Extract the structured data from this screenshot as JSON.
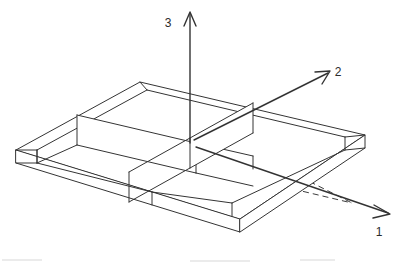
{
  "figure": {
    "background_color": "#ffffff",
    "line_color": "#343434",
    "hidden_line_color": "#3d3d3d",
    "axis_color": "#333333",
    "label_color": "#2b2b2b"
  },
  "axes": {
    "origin": {
      "x": 190,
      "y": 143
    },
    "items": [
      {
        "id": "axis-1",
        "label": "1",
        "direction": "down-right",
        "label_x": 379,
        "label_y": 232,
        "tip_x": 390,
        "tip_y": 214,
        "start_x": 196,
        "start_y": 147
      },
      {
        "id": "axis-2",
        "label": "2",
        "direction": "up-right",
        "label_x": 336,
        "label_y": 78,
        "tip_x": 330,
        "tip_y": 71,
        "start_x": 194,
        "start_y": 140
      },
      {
        "id": "axis-3",
        "label": "3",
        "direction": "up",
        "label_x": 168,
        "label_y": 23,
        "tip_x": 190,
        "tip_y": 12,
        "start_x": 190,
        "start_y": 143
      }
    ]
  },
  "slab": {
    "name": "four-compartment-slab",
    "compartment_count": 4,
    "partition_count": 2,
    "projection": "isometric",
    "top_outline": [
      {
        "x": 16,
        "y": 150
      },
      {
        "x": 140,
        "y": 82
      },
      {
        "x": 365,
        "y": 135
      },
      {
        "x": 240,
        "y": 219
      }
    ],
    "thickness_px": 13,
    "wall_height_px": 30
  },
  "labels": {
    "axis_1": "1",
    "axis_2": "2",
    "axis_3": "3"
  }
}
